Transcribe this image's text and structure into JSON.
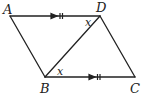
{
  "diagram": {
    "type": "parallelogram",
    "vertices": {
      "A": {
        "label": "A",
        "x": 10,
        "y": 16
      },
      "D": {
        "label": "D",
        "x": 100,
        "y": 16
      },
      "B": {
        "label": "B",
        "x": 45,
        "y": 77
      },
      "C": {
        "label": "C",
        "x": 135,
        "y": 77
      }
    },
    "segments": [
      {
        "from": "A",
        "to": "D",
        "marks": "arrow-double-tick"
      },
      {
        "from": "B",
        "to": "C",
        "marks": "arrow-double-tick"
      },
      {
        "from": "A",
        "to": "B"
      },
      {
        "from": "D",
        "to": "C"
      },
      {
        "from": "B",
        "to": "D",
        "role": "diagonal"
      }
    ],
    "angle_labels": [
      {
        "text": "x",
        "at": "D",
        "between": [
          "A",
          "B"
        ]
      },
      {
        "text": "x",
        "at": "B",
        "between": [
          "D",
          "C"
        ]
      }
    ],
    "colors": {
      "stroke": "#222222",
      "background": "#ffffff"
    }
  },
  "labels": {
    "A": "A",
    "B": "B",
    "C": "C",
    "D": "D",
    "x1": "x",
    "x2": "x"
  }
}
